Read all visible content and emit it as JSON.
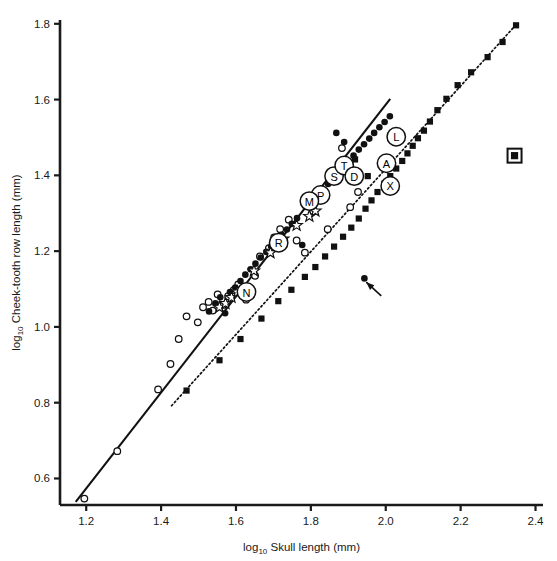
{
  "figure": {
    "background_color": "#ffffff",
    "ink_color": "#1a1a1a"
  },
  "axes": {
    "x_title_prefix": "log",
    "x_title_sub": "10",
    "x_title_main": " Skull length (mm)",
    "y_title_prefix": "log",
    "y_title_sub": "10",
    "y_title_main": " Cheek-tooth row length (mm)",
    "x_ticks": [
      "1.2",
      "1.4",
      "1.6",
      "1.8",
      "2.0",
      "2.2",
      "2.4"
    ],
    "y_ticks": [
      "0.6",
      "0.8",
      "1.0",
      "1.2",
      "1.4",
      "1.6",
      "1.8"
    ]
  },
  "chart_data": {
    "type": "scatter",
    "title": "",
    "xlabel": "log10 Skull length (mm)",
    "ylabel": "log10 Cheek-tooth row length (mm)",
    "xlim": [
      1.13,
      2.42
    ],
    "ylim": [
      0.53,
      1.81
    ],
    "grid": false,
    "legend": "none",
    "series": [
      {
        "name": "open-circle",
        "marker": "open-circle",
        "points": [
          [
            1.195,
            0.547
          ],
          [
            1.283,
            0.672
          ],
          [
            1.392,
            0.835
          ],
          [
            1.425,
            0.902
          ],
          [
            1.447,
            0.968
          ],
          [
            1.468,
            1.028
          ],
          [
            1.498,
            1.012
          ],
          [
            1.512,
            1.052
          ],
          [
            1.527,
            1.066
          ],
          [
            1.538,
            1.043
          ],
          [
            1.551,
            1.086
          ],
          [
            1.566,
            1.058
          ],
          [
            1.579,
            1.081
          ],
          [
            1.594,
            1.097
          ],
          [
            1.606,
            1.112
          ],
          [
            1.627,
            1.072
          ],
          [
            1.651,
            1.135
          ],
          [
            1.664,
            1.186
          ],
          [
            1.688,
            1.208
          ],
          [
            1.702,
            1.236
          ],
          [
            1.718,
            1.258
          ],
          [
            1.741,
            1.283
          ],
          [
            1.762,
            1.228
          ],
          [
            1.784,
            1.196
          ],
          [
            1.806,
            1.306
          ],
          [
            1.829,
            1.343
          ],
          [
            1.845,
            1.258
          ],
          [
            1.862,
            1.398
          ],
          [
            1.883,
            1.472
          ],
          [
            1.905,
            1.316
          ],
          [
            1.926,
            1.356
          ]
        ]
      },
      {
        "name": "filled-circle",
        "marker": "filled-circle",
        "points": [
          [
            1.528,
            1.041
          ],
          [
            1.545,
            1.062
          ],
          [
            1.558,
            1.078
          ],
          [
            1.571,
            1.036
          ],
          [
            1.584,
            1.092
          ],
          [
            1.598,
            1.104
          ],
          [
            1.612,
            1.121
          ],
          [
            1.625,
            1.138
          ],
          [
            1.639,
            1.152
          ],
          [
            1.652,
            1.167
          ],
          [
            1.666,
            1.183
          ],
          [
            1.681,
            1.198
          ],
          [
            1.694,
            1.212
          ],
          [
            1.708,
            1.228
          ],
          [
            1.722,
            1.243
          ],
          [
            1.736,
            1.257
          ],
          [
            1.749,
            1.272
          ],
          [
            1.763,
            1.287
          ],
          [
            1.777,
            1.216
          ],
          [
            1.791,
            1.318
          ],
          [
            1.804,
            1.333
          ],
          [
            1.818,
            1.346
          ],
          [
            1.832,
            1.362
          ],
          [
            1.846,
            1.377
          ],
          [
            1.859,
            1.392
          ],
          [
            1.873,
            1.406
          ],
          [
            1.887,
            1.421
          ],
          [
            1.901,
            1.436
          ],
          [
            1.914,
            1.452
          ],
          [
            1.928,
            1.468
          ],
          [
            1.942,
            1.482
          ],
          [
            1.956,
            1.497
          ],
          [
            1.969,
            1.512
          ],
          [
            1.983,
            1.527
          ],
          [
            1.997,
            1.541
          ],
          [
            2.011,
            1.556
          ],
          [
            1.868,
            1.512
          ],
          [
            1.889,
            1.488
          ],
          [
            1.943,
            1.128
          ]
        ]
      },
      {
        "name": "filled-square",
        "marker": "filled-square",
        "points": [
          [
            1.468,
            0.832
          ],
          [
            1.556,
            0.912
          ],
          [
            1.612,
            0.968
          ],
          [
            1.668,
            1.022
          ],
          [
            1.713,
            1.068
          ],
          [
            1.748,
            1.098
          ],
          [
            1.784,
            1.132
          ],
          [
            1.812,
            1.158
          ],
          [
            1.838,
            1.186
          ],
          [
            1.862,
            1.212
          ],
          [
            1.886,
            1.238
          ],
          [
            1.908,
            1.262
          ],
          [
            1.928,
            1.286
          ],
          [
            1.946,
            1.312
          ],
          [
            1.962,
            1.334
          ],
          [
            1.978,
            1.356
          ],
          [
            1.996,
            1.378
          ],
          [
            2.012,
            1.398
          ],
          [
            2.028,
            1.418
          ],
          [
            2.044,
            1.438
          ],
          [
            2.058,
            1.458
          ],
          [
            2.072,
            1.478
          ],
          [
            2.086,
            1.498
          ],
          [
            2.102,
            1.518
          ],
          [
            2.118,
            1.542
          ],
          [
            2.138,
            1.572
          ],
          [
            2.162,
            1.602
          ],
          [
            2.192,
            1.638
          ],
          [
            2.228,
            1.672
          ],
          [
            2.272,
            1.712
          ],
          [
            2.312,
            1.752
          ],
          [
            2.348,
            1.796
          ],
          [
            1.882,
            1.412
          ],
          [
            1.918,
            1.442
          ],
          [
            1.952,
            1.398
          ]
        ]
      },
      {
        "name": "star",
        "marker": "star",
        "points": [
          [
            1.556,
            1.052
          ],
          [
            1.572,
            1.062
          ],
          [
            1.588,
            1.078
          ],
          [
            1.604,
            1.092
          ],
          [
            1.648,
            1.148
          ],
          [
            1.692,
            1.196
          ],
          [
            1.726,
            1.232
          ],
          [
            1.762,
            1.268
          ],
          [
            1.796,
            1.292
          ],
          [
            1.812,
            1.306
          ]
        ]
      },
      {
        "name": "isolated-boxed-square",
        "marker": "square-in-square",
        "points": [
          [
            2.344,
            1.452
          ]
        ]
      }
    ],
    "labeled_points": [
      {
        "label": "L",
        "x": 2.028,
        "y": 1.502
      },
      {
        "label": "A",
        "x": 2.002,
        "y": 1.432
      },
      {
        "label": "X",
        "x": 2.012,
        "y": 1.372
      },
      {
        "label": "S",
        "x": 1.862,
        "y": 1.398
      },
      {
        "label": "T",
        "x": 1.889,
        "y": 1.426
      },
      {
        "label": "D",
        "x": 1.916,
        "y": 1.398
      },
      {
        "label": "P",
        "x": 1.826,
        "y": 1.348
      },
      {
        "label": "M",
        "x": 1.796,
        "y": 1.332
      },
      {
        "label": "R",
        "x": 1.714,
        "y": 1.222
      },
      {
        "label": "N",
        "x": 1.628,
        "y": 1.092
      }
    ],
    "fit_lines": [
      {
        "name": "solid-regression-line",
        "style": "solid",
        "x1": 1.172,
        "y1": 0.538,
        "x2": 2.012,
        "y2": 1.602
      },
      {
        "name": "dotted-regression-line",
        "style": "dotted",
        "x1": 1.428,
        "y1": 0.792,
        "x2": 2.352,
        "y2": 1.802
      }
    ],
    "annotations": [
      {
        "name": "outlier-arrow",
        "type": "arrow",
        "tail_x": 1.988,
        "tail_y": 1.082,
        "head_x": 1.948,
        "head_y": 1.118
      }
    ]
  }
}
